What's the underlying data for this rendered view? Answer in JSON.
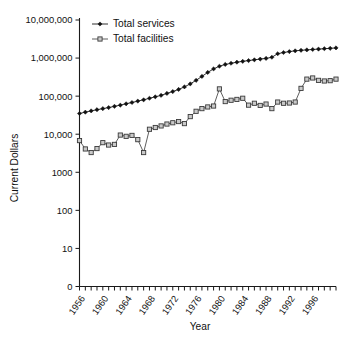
{
  "chart_data": {
    "type": "line",
    "title": "",
    "xlabel": "Year",
    "ylabel": "Current Dollars",
    "yscale": "log-like-category",
    "ytick_labels": [
      "10,000,000",
      "1,000,000",
      "100,000",
      "10,000",
      "1000",
      "100",
      "10",
      "0"
    ],
    "ytick_values": [
      10000000,
      1000000,
      100000,
      10000,
      1000,
      100,
      10,
      0
    ],
    "xtick_labels": [
      "1956",
      "1960",
      "1964",
      "1968",
      "1972",
      "1976",
      "1980",
      "1984",
      "1988",
      "1992",
      "1996"
    ],
    "xtick_values": [
      1956,
      1960,
      1964,
      1968,
      1972,
      1976,
      1980,
      1984,
      1988,
      1992,
      1996
    ],
    "xlim": [
      1956,
      2000
    ],
    "grid": false,
    "legend_position": "top-left-inside",
    "x": [
      1956,
      1957,
      1958,
      1959,
      1960,
      1961,
      1962,
      1963,
      1964,
      1965,
      1966,
      1967,
      1968,
      1969,
      1970,
      1971,
      1972,
      1973,
      1974,
      1975,
      1976,
      1977,
      1978,
      1979,
      1980,
      1981,
      1982,
      1983,
      1984,
      1985,
      1986,
      1987,
      1988,
      1989,
      1990,
      1991,
      1992,
      1993,
      1994,
      1995,
      1996,
      1997,
      1998,
      1999,
      2000
    ],
    "series": [
      {
        "name": "Total services",
        "marker": "filled-diamond",
        "color": "#111111",
        "values": [
          35000,
          38000,
          41000,
          44000,
          47000,
          50000,
          54000,
          58000,
          63000,
          68000,
          74000,
          80000,
          88000,
          96000,
          105000,
          118000,
          132000,
          150000,
          175000,
          210000,
          260000,
          330000,
          420000,
          520000,
          610000,
          680000,
          730000,
          780000,
          820000,
          860000,
          900000,
          940000,
          980000,
          1050000,
          1300000,
          1400000,
          1480000,
          1550000,
          1600000,
          1640000,
          1680000,
          1720000,
          1760000,
          1800000,
          1850000
        ]
      },
      {
        "name": "Total facilities",
        "marker": "open-square",
        "color": "#c9c9c9",
        "values": [
          6800,
          4100,
          3300,
          4200,
          6000,
          5200,
          5400,
          9500,
          8800,
          9300,
          7200,
          3300,
          13500,
          15000,
          16500,
          18500,
          20000,
          21500,
          19000,
          29000,
          40000,
          47000,
          52000,
          55000,
          155000,
          72000,
          78000,
          82000,
          88000,
          58000,
          65000,
          57000,
          62000,
          47000,
          70000,
          65000,
          66000,
          70000,
          160000,
          280000,
          300000,
          260000,
          250000,
          255000,
          280000
        ]
      }
    ]
  },
  "legend": {
    "entries": [
      {
        "label": "Total services",
        "marker": "filled-diamond"
      },
      {
        "label": "Total facilities",
        "marker": "open-square"
      }
    ]
  },
  "axes": {
    "y_title": "Current Dollars",
    "x_title": "Year"
  },
  "colors": {
    "axis": "#1a1a1a",
    "services": "#111111",
    "facilities_fill": "#c9c9c9",
    "facilities_stroke": "#3a3a3a",
    "background": "#ffffff"
  }
}
